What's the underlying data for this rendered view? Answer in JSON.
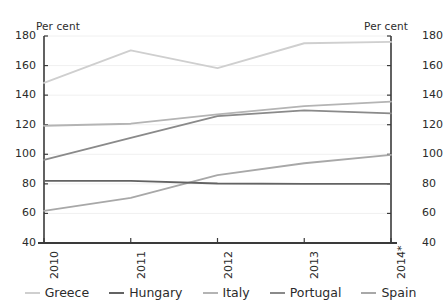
{
  "axes": {
    "left_unit_label": "Per cent",
    "right_unit_label": "Per cent",
    "y_ticks": [
      "40",
      "60",
      "80",
      "100",
      "120",
      "140",
      "160",
      "180"
    ],
    "x_ticks": [
      "2010",
      "2011",
      "2012",
      "2013",
      "2014*"
    ]
  },
  "legend": {
    "items": [
      {
        "label": "Greece",
        "color": "#cfcfcf"
      },
      {
        "label": "Hungary",
        "color": "#636363"
      },
      {
        "label": "Italy",
        "color": "#b4b4b4"
      },
      {
        "label": "Portugal",
        "color": "#8a8a8a"
      },
      {
        "label": "Spain",
        "color": "#a8a8a8"
      }
    ]
  },
  "chart_data": {
    "type": "line",
    "title": "",
    "subtitle": "",
    "xlabel": "",
    "ylabel": "Per cent",
    "y2label": "Per cent",
    "categories": [
      "2010",
      "2011",
      "2012",
      "2013",
      "2014*"
    ],
    "ylim": [
      40,
      180
    ],
    "ytick_step": 20,
    "grid": true,
    "legend_position": "bottom",
    "footnote_marker": "*",
    "series": [
      {
        "name": "Greece",
        "color": "#cfcfcf",
        "values": [
          148.3,
          170.3,
          158.3,
          175.1,
          176.0
        ]
      },
      {
        "name": "Hungary",
        "color": "#636363",
        "values": [
          82.0,
          82.0,
          80.2,
          80.0,
          80.0
        ]
      },
      {
        "name": "Italy",
        "color": "#b4b4b4",
        "values": [
          119.3,
          120.7,
          127.0,
          132.6,
          135.6
        ]
      },
      {
        "name": "Portugal",
        "color": "#8a8a8a",
        "values": [
          96.2,
          111.1,
          125.8,
          129.7,
          127.7
        ]
      },
      {
        "name": "Spain",
        "color": "#a8a8a8",
        "values": [
          61.7,
          70.5,
          85.9,
          93.9,
          99.6
        ]
      }
    ]
  }
}
